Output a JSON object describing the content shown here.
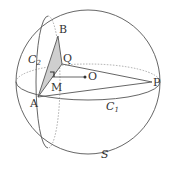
{
  "diagram": {
    "colors": {
      "stroke": "#555555",
      "dotted": "#888888",
      "fill_triangle": "#cfcfcf",
      "text": "#333333",
      "background": "#ffffff"
    },
    "labels": {
      "B": "B",
      "Q": "Q",
      "O": "O",
      "P": "P",
      "M": "M",
      "A": "A",
      "C2_main": "C",
      "C2_sub": "2",
      "C1_main": "C",
      "C1_sub": "1",
      "S": "S"
    },
    "points": {
      "O": {
        "x": 85,
        "y": 76
      },
      "P": {
        "x": 152,
        "y": 82
      },
      "A": {
        "x": 38,
        "y": 97
      },
      "B": {
        "x": 58,
        "y": 36
      },
      "Q": {
        "x": 62,
        "y": 64
      },
      "M": {
        "x": 52,
        "y": 77
      }
    },
    "sphere": {
      "cx": 88,
      "cy": 82,
      "r": 72
    },
    "great_circle_C1": {
      "cx": 88,
      "cy": 82,
      "rx": 72,
      "ry": 18
    },
    "great_circle_C2": {
      "cx": 48,
      "cy": 82,
      "rx": 12,
      "ry": 66
    }
  }
}
